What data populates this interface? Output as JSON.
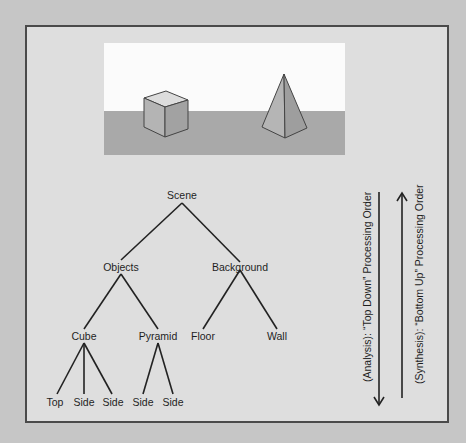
{
  "figure": {
    "scene_image": {
      "objects": [
        "cube",
        "pyramid"
      ],
      "regions": [
        "sky-wall",
        "floor"
      ]
    },
    "tree": {
      "root": "Scene",
      "level1": [
        "Objects",
        "Background"
      ],
      "level2": [
        "Cube",
        "Pyramid",
        "Floor",
        "Wall"
      ],
      "level3": [
        "Top",
        "Side",
        "Side",
        "Side",
        "Side"
      ]
    },
    "arrows": {
      "analysis_label": "(Analysis):  “Top Down” Processing Order",
      "synthesis_label": "(Synthesis):  “Bottom Up” Processing Order"
    },
    "colors": {
      "page_bg": "#c6c6c6",
      "panel_bg": "#dedede",
      "border": "#4a4a4a",
      "wall": "#fbfbfb",
      "floor": "#a9a9a9"
    }
  }
}
